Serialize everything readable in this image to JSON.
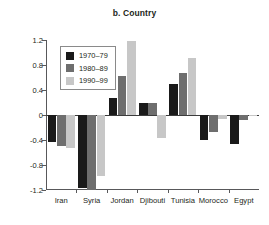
{
  "chart_data": {
    "type": "bar",
    "title": "b. Country",
    "xlabel": "",
    "ylabel": "",
    "ylim": [
      -1.2,
      1.2
    ],
    "yticks": [
      "1.2",
      "0.8",
      "0.4",
      "0",
      "-0.4",
      "-0.8",
      "-1.2"
    ],
    "ytick_values": [
      1.2,
      0.8,
      0.4,
      0,
      -0.4,
      -0.8,
      -1.2
    ],
    "grid": false,
    "legend_position": "top-left-inside",
    "categories": [
      "Iran",
      "Syria",
      "Jordan",
      "Djibouti",
      "Tunisia",
      "Morocco",
      "Egypt"
    ],
    "series": [
      {
        "name": "1970–79",
        "color": "#1a1a1a",
        "values": [
          -0.43,
          -1.16,
          0.27,
          0.19,
          0.5,
          -0.4,
          -0.46
        ]
      },
      {
        "name": "1980–89",
        "color": "#6e6e6e",
        "values": [
          -0.5,
          -1.2,
          0.63,
          0.19,
          0.67,
          -0.27,
          -0.08
        ]
      },
      {
        "name": "1990–99",
        "color": "#c7c7c7",
        "values": [
          -0.52,
          -0.98,
          1.19,
          -0.37,
          0.92,
          -0.06,
          -0.01
        ]
      }
    ]
  },
  "legend": {
    "items": [
      {
        "label": "1970–79",
        "swatch": "d1"
      },
      {
        "label": "1980–89",
        "swatch": "d2"
      },
      {
        "label": "1990–99",
        "swatch": "d3"
      }
    ]
  }
}
